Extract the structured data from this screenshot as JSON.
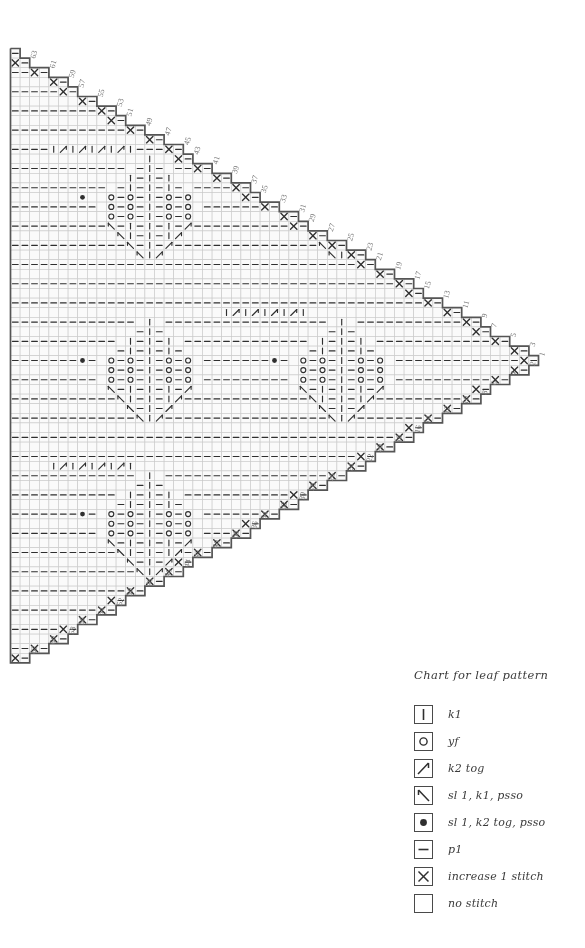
{
  "legend": {
    "title": "Chart for leaf pattern",
    "items": [
      {
        "symbol": "k1",
        "icon": "vertical-bar-icon",
        "label": "k1"
      },
      {
        "symbol": "yf",
        "icon": "circle-icon",
        "label": "yf"
      },
      {
        "symbol": "k2tog",
        "icon": "diagonal-right-icon",
        "label": "k2 tog"
      },
      {
        "symbol": "skp",
        "icon": "diagonal-left-icon",
        "label": "sl 1, k1, psso"
      },
      {
        "symbol": "sk2p",
        "icon": "filled-dot-icon",
        "label": "sl 1, k2 tog, psso"
      },
      {
        "symbol": "p1",
        "icon": "horizontal-dash-icon",
        "label": "p1"
      },
      {
        "symbol": "inc",
        "icon": "cross-icon",
        "label": "increase 1 stitch"
      },
      {
        "symbol": "none",
        "icon": "blank-icon",
        "label": "no stitch"
      }
    ]
  },
  "chart_data": {
    "type": "table",
    "title": "Chart for leaf pattern",
    "rows": 64,
    "max_columns": 55,
    "cell_size": 9.6,
    "origin": {
      "x": 10,
      "y": 872
    },
    "grid": true,
    "colors": {
      "grid_line": "#c9c9c9",
      "outline": "#555555",
      "symbol": "#2f2f2f",
      "number": "#7a7a7a",
      "background": "#ffffff",
      "cell_fill": "#fafafa"
    },
    "row_number_labels_odd": [
      1,
      3,
      5,
      7,
      9,
      11,
      13,
      15,
      17,
      19,
      21,
      23,
      25,
      27,
      29,
      31,
      33,
      35,
      37,
      39,
      41,
      43,
      45,
      47,
      49,
      51,
      53,
      55,
      57,
      59,
      61,
      63
    ],
    "row_number_labels_even": [
      2,
      4,
      6,
      8,
      10,
      12,
      14,
      16,
      18,
      20,
      22,
      24,
      26,
      28,
      30,
      32,
      34,
      36,
      38,
      40,
      42,
      44,
      46,
      48,
      50,
      52,
      54,
      56,
      58,
      60,
      62,
      64
    ],
    "symbol_key": {
      "k": "k1 vertical bar",
      "p": "p1 horizontal dash",
      "o": "yf open circle",
      "/": "k2 tog diagonal",
      "\\": "sl 1 k1 psso diagonal",
      "d": "sl 1 k2 tog psso filled dot",
      "x": "increase 1 stitch cross",
      ".": "empty cell",
      " ": "no stitch"
    },
    "motif_band_row": "| / | / | / | / |",
    "leaf_motif_widths": [
      1,
      3,
      5,
      7,
      9,
      9,
      9,
      7,
      5,
      3,
      1
    ]
  }
}
